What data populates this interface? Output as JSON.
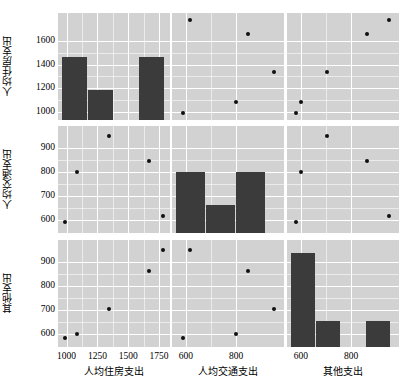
{
  "figure": {
    "type": "scatter-plot-matrix",
    "background": "#ffffff",
    "panel_background": "#d2d2d2",
    "grid_color": "#ffffff",
    "bar_color": "#3b3b3b",
    "point_color": "#101010",
    "n_rows": 3,
    "n_cols": 3
  },
  "variables": [
    {
      "key": "housing",
      "label": "人均住房支出",
      "ticks": [
        1000,
        1250,
        1500,
        1750
      ],
      "ytick_labels": [
        "1000",
        "1200",
        "1400",
        "1600"
      ],
      "yticks": [
        1000,
        1200,
        1400,
        1600
      ],
      "xtick_labels": [
        "1000",
        "1250",
        "1500",
        "1750"
      ],
      "range": [
        930,
        1840
      ]
    },
    {
      "key": "transport",
      "label": "人均交通支出",
      "ticks": [
        600,
        800
      ],
      "ytick_labels": [
        "600",
        "700",
        "800",
        "900"
      ],
      "yticks": [
        600,
        700,
        800,
        900
      ],
      "xtick_labels": [
        "600",
        "800"
      ],
      "range": [
        545,
        990
      ]
    },
    {
      "key": "other",
      "label": "其他支出",
      "ticks": [
        600,
        800
      ],
      "ytick_labels": [
        "600",
        "700",
        "800",
        "900"
      ],
      "yticks": [
        600,
        700,
        800,
        900
      ],
      "xtick_labels": [
        "600",
        "800"
      ],
      "range": [
        545,
        990
      ]
    }
  ],
  "chart_data": {
    "type": "scatter",
    "title": "",
    "xlabel": "",
    "ylabel": "",
    "grid": true,
    "legend": "none",
    "dimensions": [
      "人均住房支出",
      "人均交通支出",
      "其他支出"
    ],
    "axis_ranges": {
      "人均住房支出": [
        930,
        1840
      ],
      "人均交通支出": [
        545,
        990
      ],
      "其他支出": [
        545,
        990
      ]
    },
    "points": [
      {
        "housing": 990,
        "transport": 590,
        "other": 582
      },
      {
        "housing": 1080,
        "transport": 800,
        "other": 600
      },
      {
        "housing": 1340,
        "transport": 950,
        "other": 705
      },
      {
        "housing": 1665,
        "transport": 845,
        "other": 862
      },
      {
        "housing": 1785,
        "transport": 615,
        "other": 950
      }
    ],
    "histograms": [
      {
        "variable": "人均住房支出",
        "position": "row1-col1",
        "bin_edges": [
          960,
          1170,
          1380,
          1590,
          1800
        ],
        "bin_centers": [
          1065,
          1275,
          1485,
          1695
        ],
        "counts": [
          2,
          1,
          0,
          2
        ],
        "bar_tops_in_y_units": [
          1470,
          1185,
          0,
          1470
        ],
        "baseline_y": 930
      },
      {
        "variable": "人均交通支出",
        "position": "row2-col2",
        "bin_edges": [
          560,
          680,
          800,
          920
        ],
        "bin_centers": [
          620,
          740,
          860
        ],
        "counts": [
          2,
          1,
          2
        ],
        "bar_tops_in_y_units": [
          800,
          660,
          800
        ],
        "baseline_y": 545
      },
      {
        "variable": "其他支出",
        "position": "row3-col3",
        "bin_edges": [
          560,
          660,
          760,
          860,
          960
        ],
        "bin_centers": [
          610,
          710,
          810,
          910
        ],
        "counts": [
          3,
          1,
          0,
          1
        ],
        "bar_tops_in_y_units": [
          935,
          655,
          0,
          655
        ],
        "baseline_y": 545
      }
    ]
  }
}
